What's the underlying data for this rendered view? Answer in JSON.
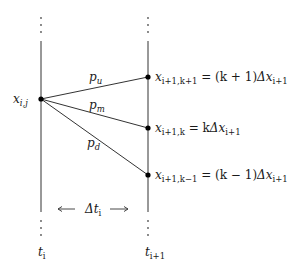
{
  "diagram": {
    "type": "trinomial-tree-branch",
    "source_node": {
      "label_var": "x",
      "label_sub": "i,j"
    },
    "branches": [
      {
        "prob_var": "p",
        "prob_sub": "u"
      },
      {
        "prob_var": "p",
        "prob_sub": "m"
      },
      {
        "prob_var": "p",
        "prob_sub": "d"
      }
    ],
    "target_nodes": [
      {
        "var": "x",
        "sub": "i+1,k+1",
        "eq": " = (k + 1)",
        "delta": "Δx",
        "delta_sub": "i+1"
      },
      {
        "var": "x",
        "sub": "i+1,k",
        "eq": " = k",
        "delta": "Δx",
        "delta_sub": "i+1"
      },
      {
        "var": "x",
        "sub": "i+1,k−1",
        "eq": " = (k − 1)",
        "delta": "Δx",
        "delta_sub": "i+1"
      }
    ],
    "time_step": {
      "left_arrow": "⟵",
      "var": "Δt",
      "sub": "i",
      "right_arrow": "⟶"
    },
    "time_axes": [
      {
        "var": "t",
        "sub": "i"
      },
      {
        "var": "t",
        "sub": "i+1"
      }
    ],
    "colors": {
      "line": "#333333",
      "dot": "#000000",
      "text": "#1a1a1a"
    }
  }
}
